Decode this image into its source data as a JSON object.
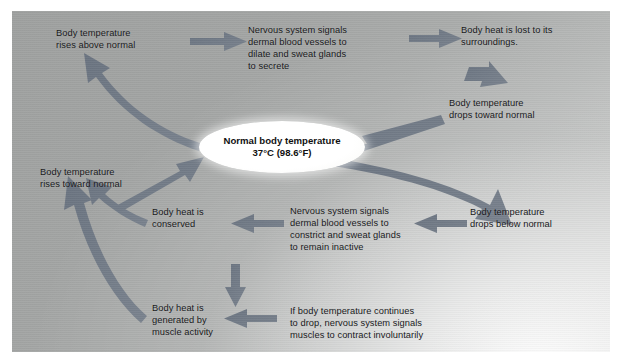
{
  "diagram": {
    "background_color": "#a8aaa9",
    "arrow_color": "#6f7884",
    "text_color": "#17181a",
    "center": {
      "line1": "Normal body temperature",
      "line2": "37°C (98.6°F)"
    },
    "nodes": [
      {
        "id": "temp-rises-above-normal",
        "text": "Body temperature\nrises above normal"
      },
      {
        "id": "nervous-dilate-sweat",
        "text": "Nervous system signals\ndermal blood vessels to\ndilate and sweat glands\nto secrete"
      },
      {
        "id": "heat-lost-surroundings",
        "text": "Body heat is lost to its\nsurroundings."
      },
      {
        "id": "temp-drops-toward-normal",
        "text": "Body temperature\ndrops toward normal"
      },
      {
        "id": "temp-drops-below-normal",
        "text": "Body temperature\ndrops below normal"
      },
      {
        "id": "nervous-constrict-inactive",
        "text": "Nervous system signals\ndermal blood vessels to\nconstrict and sweat glands\nto remain inactive"
      },
      {
        "id": "heat-conserved",
        "text": "Body heat is\nconserved"
      },
      {
        "id": "temp-rises-toward-normal",
        "text": "Body temperature\nrises toward normal"
      },
      {
        "id": "if-temp-continues-drop",
        "text": "If body temperature continues\nto drop, nervous system signals\nmuscles to contract involuntarily"
      },
      {
        "id": "heat-generated-muscle",
        "text": "Body heat is\ngenerated by\nmuscle activity"
      }
    ]
  }
}
